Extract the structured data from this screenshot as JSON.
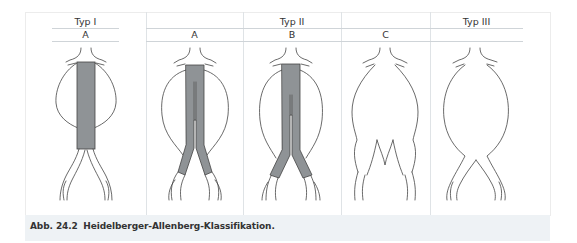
{
  "figure": {
    "caption_number": "Abb. 24.2",
    "caption_text": "Heidelberger-Allenberg-Klassifikation.",
    "types": [
      {
        "label": "Typ I",
        "subtypes": [
          "A"
        ]
      },
      {
        "label": "Typ II",
        "subtypes": [
          "A",
          "B",
          "C"
        ]
      },
      {
        "label": "Typ III",
        "subtypes": [
          ""
        ]
      }
    ],
    "panels": [
      {
        "type": "Typ I",
        "subtype": "A",
        "graft": "tube"
      },
      {
        "type": "Typ II",
        "subtype": "A",
        "graft": "bifurcated-iliac"
      },
      {
        "type": "Typ II",
        "subtype": "B",
        "graft": "bifurcated-iliac-extended"
      },
      {
        "type": "Typ II",
        "subtype": "C",
        "graft": "none"
      },
      {
        "type": "Typ III",
        "subtype": "",
        "graft": "none"
      }
    ],
    "colors": {
      "graft_fill": "#8f9396",
      "outline": "#444444",
      "caption_band": "#eef2f5",
      "grid_line": "#cfd4d8"
    }
  }
}
